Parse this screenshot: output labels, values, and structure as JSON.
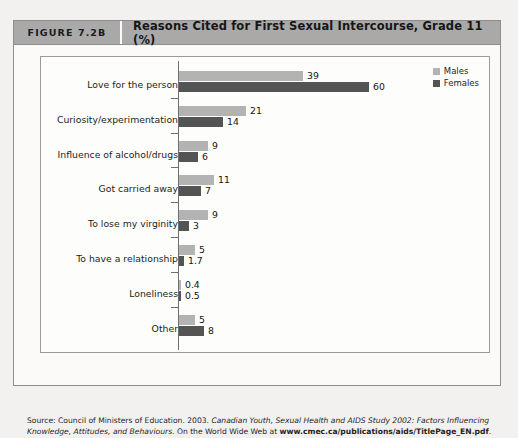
{
  "header": {
    "figure_number": "FIGURE 7.2B",
    "title": "Reasons Cited for First Sexual Intercourse, Grade 11 (%)",
    "bg_color": "#a9a9a9"
  },
  "legend": {
    "items": [
      {
        "label": "Males",
        "color": "#b3b3b3"
      },
      {
        "label": "Females",
        "color": "#545454"
      }
    ]
  },
  "source": {
    "prefix": "Source: Council of Ministers of Education. 2003. ",
    "italic1": "Canadian Youth, Sexual Health and AIDS Study 2002: Factors Influencing Knowledge, Attitudes, and Behaviours",
    "middle": ". On the World Wide Web at ",
    "url": "www.cmec.ca/publications/aids/TitlePage_EN.pdf",
    "suffix": "."
  },
  "chart_data": {
    "type": "bar",
    "orientation": "horizontal",
    "title": "Reasons Cited for First Sexual Intercourse, Grade 11 (%)",
    "xlabel": "",
    "ylabel": "",
    "xlim": [
      0,
      60
    ],
    "grid": false,
    "legend_position": "top-right",
    "categories": [
      "Love for the person",
      "Curiosity/experimentation",
      "Influence of alcohol/drugs",
      "Got carried away",
      "To lose my virginity",
      "To have a relationship",
      "Loneliness",
      "Other"
    ],
    "series": [
      {
        "name": "Males",
        "color": "#b3b3b3",
        "values": [
          39,
          21,
          9,
          11,
          9,
          5,
          0.4,
          5
        ],
        "labels": [
          "39",
          "21",
          "9",
          "11",
          "9",
          "5",
          "0.4",
          "5"
        ]
      },
      {
        "name": "Females",
        "color": "#545454",
        "values": [
          60,
          14,
          6,
          7,
          3,
          1.7,
          0.5,
          8
        ],
        "labels": [
          "60",
          "14",
          "6",
          "7",
          "3",
          "1.7",
          "0.5",
          "8"
        ]
      }
    ]
  }
}
